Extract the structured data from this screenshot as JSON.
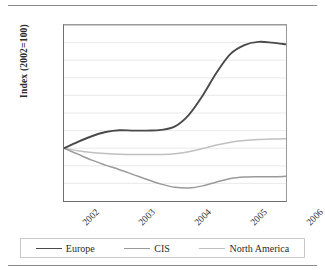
{
  "figure": {
    "rule_top": "horizontal-rule",
    "rule_bottom": "horizontal-rule"
  },
  "chart_data": {
    "type": "line",
    "title": "",
    "xlabel": "",
    "ylabel": "Index (2002=100)",
    "ylim": [
      85,
      135
    ],
    "yticks": [
      85,
      90,
      95,
      100,
      105,
      110,
      115,
      120,
      125,
      130,
      135
    ],
    "xlim": [
      2002,
      2006
    ],
    "categories": [
      "2002",
      "2003",
      "2004",
      "2005",
      "2006"
    ],
    "grid": "horizontal",
    "legend_position": "bottom",
    "series": [
      {
        "name": "Europe",
        "color": "#4a4a4a",
        "width": 1.9,
        "x": [
          2002,
          2002.25,
          2002.5,
          2002.75,
          2003,
          2003.25,
          2003.5,
          2003.75,
          2004,
          2004.25,
          2004.5,
          2004.75,
          2005,
          2005.25,
          2005.5,
          2005.75,
          2006
        ],
        "values": [
          100.0,
          101.8,
          103.4,
          104.6,
          105.1,
          105.0,
          105.0,
          105.2,
          106.2,
          109.5,
          115.0,
          121.5,
          126.8,
          129.3,
          130.2,
          130.0,
          129.5
        ]
      },
      {
        "name": "CIS",
        "color": "#9a9a9a",
        "width": 1.5,
        "x": [
          2002,
          2002.25,
          2002.5,
          2002.75,
          2003,
          2003.25,
          2003.5,
          2003.75,
          2004,
          2004.25,
          2004.5,
          2004.75,
          2005,
          2005.25,
          2005.5,
          2005.75,
          2006
        ],
        "values": [
          100.0,
          98.3,
          96.6,
          95.2,
          93.9,
          92.5,
          91.1,
          89.8,
          88.9,
          88.7,
          89.3,
          90.4,
          91.4,
          91.8,
          91.9,
          91.9,
          92.0
        ]
      },
      {
        "name": "North America",
        "color": "#c0c0c0",
        "width": 1.5,
        "x": [
          2002,
          2002.25,
          2002.5,
          2002.75,
          2003,
          2003.25,
          2003.5,
          2003.75,
          2004,
          2004.25,
          2004.5,
          2004.75,
          2005,
          2005.25,
          2005.5,
          2005.75,
          2006
        ],
        "values": [
          100.0,
          99.3,
          98.8,
          98.5,
          98.3,
          98.2,
          98.2,
          98.2,
          98.4,
          99.0,
          99.9,
          100.9,
          101.7,
          102.2,
          102.5,
          102.6,
          102.7
        ]
      }
    ]
  }
}
